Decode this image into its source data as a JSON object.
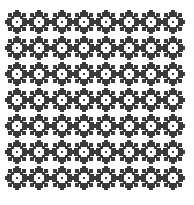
{
  "pattern": {
    "name": "flower-motif-tile-pattern",
    "rows": 7,
    "cols": 8,
    "origin_x": 5,
    "origin_y": 10,
    "pitch_x": 22.3,
    "pitch_y": 26,
    "motif_size": 24,
    "colors": {
      "background": "#ffffff",
      "motif": "#3a3a3a",
      "center": "#ffffff",
      "dot": "#3a3a3a"
    },
    "motif_icon": "flower-icon"
  }
}
